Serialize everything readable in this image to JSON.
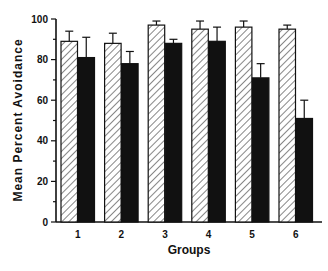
{
  "chart_data": {
    "type": "bar",
    "title": "",
    "xlabel": "Groups",
    "ylabel": "Mean Percent Avoidance",
    "categories": [
      "1",
      "2",
      "3",
      "4",
      "5",
      "6"
    ],
    "ylim": [
      0,
      100
    ],
    "yticks": [
      0,
      20,
      40,
      60,
      80,
      100
    ],
    "grid": false,
    "legend": null,
    "series": [
      {
        "name": "hatched",
        "fill": "hatched",
        "values": [
          89,
          88,
          97,
          95,
          96,
          95
        ],
        "error_upper": [
          94,
          93,
          99,
          99,
          99,
          97
        ]
      },
      {
        "name": "solid",
        "fill": "#111111",
        "values": [
          81,
          78,
          88,
          89,
          71,
          51
        ],
        "error_upper": [
          91,
          84,
          90,
          96,
          78,
          60
        ]
      }
    ]
  }
}
